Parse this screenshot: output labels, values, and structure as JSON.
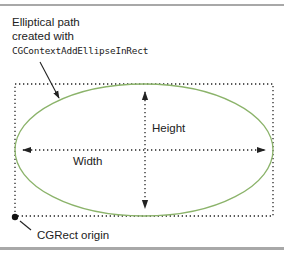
{
  "diagram": {
    "callout": {
      "line1": "Elliptical path",
      "line2": "created with",
      "function_name": "CGContextAddEllipseInRect"
    },
    "labels": {
      "height": "Height",
      "width": "Width",
      "origin": "CGRect origin"
    },
    "colors": {
      "ellipse": "#8bb36a",
      "rect_border": "#222222",
      "arrow": "#222222",
      "rule": "#a8a8a8"
    },
    "geometry": {
      "rect": {
        "x": 15,
        "y": 84,
        "width": 258,
        "height": 132
      },
      "ellipse": {
        "cx": 144,
        "cy": 150,
        "rx": 129,
        "ry": 66
      }
    }
  }
}
